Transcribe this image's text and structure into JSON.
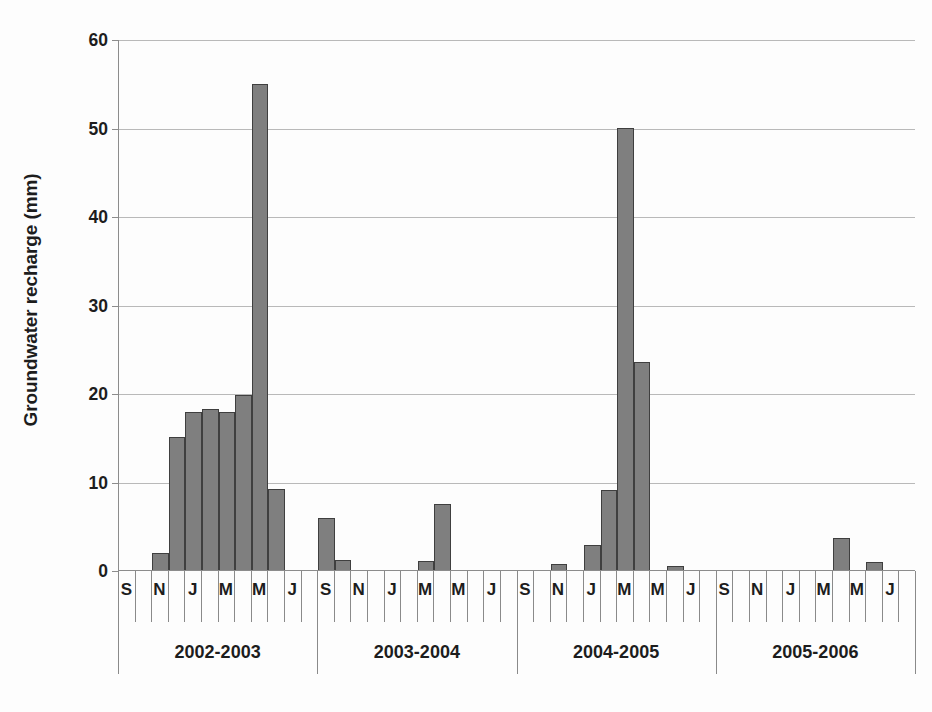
{
  "chart_data": {
    "type": "bar",
    "title": "",
    "xlabel": "",
    "ylabel": "Groundwater recharge (mm)",
    "ylim": [
      0,
      60
    ],
    "ytick_labels": [
      "0",
      "10",
      "20",
      "30",
      "40",
      "50",
      "60"
    ],
    "ytick_values": [
      0,
      10,
      20,
      30,
      40,
      50,
      60
    ],
    "grid": true,
    "legend": "none",
    "bar_color": "#7f7f7f",
    "bar_edge_color": "#3f3f3f",
    "groups": [
      "2002-2003",
      "2003-2004",
      "2004-2005",
      "2005-2006"
    ],
    "months_per_group": 12,
    "month_codes": [
      "S",
      "O",
      "N",
      "D",
      "J",
      "F",
      "M",
      "A",
      "M",
      "J",
      "J",
      "A"
    ],
    "month_tick_labels": [
      "S",
      "",
      "N",
      "",
      "J",
      "",
      "M",
      "",
      "M",
      "",
      "J",
      ""
    ],
    "categories": [
      "2002-S",
      "2002-O",
      "2002-N",
      "2002-D",
      "2003-J",
      "2003-F",
      "2003-M",
      "2003-A",
      "2003-M",
      "2003-J",
      "2003-J",
      "2003-A",
      "2003-S",
      "2003-O",
      "2003-N",
      "2003-D",
      "2004-J",
      "2004-F",
      "2004-M",
      "2004-A",
      "2004-M",
      "2004-J",
      "2004-J",
      "2004-A",
      "2004-S",
      "2004-O",
      "2004-N",
      "2004-D",
      "2005-J",
      "2005-F",
      "2005-M",
      "2005-A",
      "2005-M",
      "2005-J",
      "2005-J",
      "2005-A",
      "2005-S",
      "2005-O",
      "2005-N",
      "2005-D",
      "2006-J",
      "2006-F",
      "2006-M",
      "2006-A",
      "2006-M",
      "2006-J",
      "2006-J",
      "2006-A"
    ],
    "values": [
      0,
      0,
      1.9,
      15.0,
      17.8,
      18.2,
      17.8,
      19.8,
      54.9,
      9.1,
      0,
      0,
      5.9,
      1.1,
      0,
      0,
      0,
      0,
      1.0,
      7.5,
      0,
      0,
      0,
      0,
      0,
      0,
      0.7,
      0,
      2.8,
      9.0,
      50.0,
      23.5,
      0,
      0.4,
      0,
      0,
      0,
      0,
      0,
      0,
      0,
      0,
      0,
      3.6,
      0,
      0.9,
      0,
      0
    ]
  }
}
